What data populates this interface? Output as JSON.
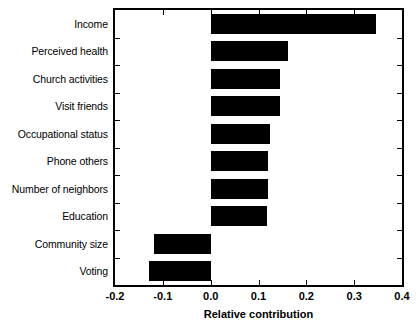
{
  "chart_data": {
    "type": "bar",
    "orientation": "horizontal",
    "title": "",
    "xlabel": "Relative contribution",
    "ylabel": "",
    "categories": [
      "Income",
      "Perceived health",
      "Church activities",
      "Visit friends",
      "Occupational status",
      "Phone others",
      "Number of neighbors",
      "Education",
      "Community size",
      "Voting"
    ],
    "values": [
      0.346,
      0.161,
      0.144,
      0.144,
      0.124,
      0.119,
      0.119,
      0.118,
      -0.118,
      -0.128
    ],
    "xlim": [
      -0.2,
      0.4
    ],
    "xticks": [
      -0.2,
      -0.1,
      0.0,
      0.1,
      0.2,
      0.3,
      0.4
    ],
    "xticklabels": [
      "-0.2",
      "-0.1",
      "0.0",
      "0.1",
      "0.2",
      "0.3",
      "0.4"
    ],
    "grid": false,
    "legend": null,
    "bar_color": "#000000",
    "frame_color": "#000000",
    "background_color": "#ffffff"
  }
}
